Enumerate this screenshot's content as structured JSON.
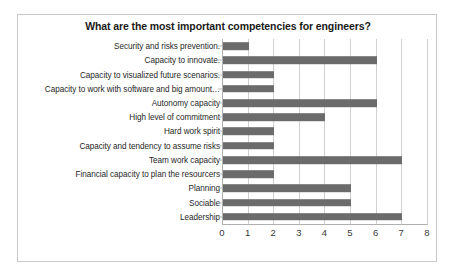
{
  "chart_data": {
    "type": "bar",
    "orientation": "horizontal",
    "title": "What are the most important competencies for engineers?",
    "xlabel": "",
    "ylabel": "",
    "xlim": [
      0,
      8
    ],
    "xticks": [
      0,
      1,
      2,
      3,
      4,
      5,
      6,
      7,
      8
    ],
    "grid": true,
    "legend": false,
    "bar_color": "#6b6b6b",
    "categories": [
      "Security and risks prevention.",
      "Capacity to innovate.",
      "Capacity to visualized future scenarios.",
      "Capacity to work with software and big amount…",
      "Autonomy capacity",
      "High level of commitment",
      "Hard work spirit",
      "Capacity and tendency to assume risks",
      "Team work capacity",
      "Financial capacity to plan the resourcers",
      "Planning",
      "Sociable",
      "Leadership"
    ],
    "values": [
      1,
      6,
      2,
      2,
      6,
      4,
      2,
      2,
      7,
      2,
      5,
      5,
      7
    ]
  }
}
